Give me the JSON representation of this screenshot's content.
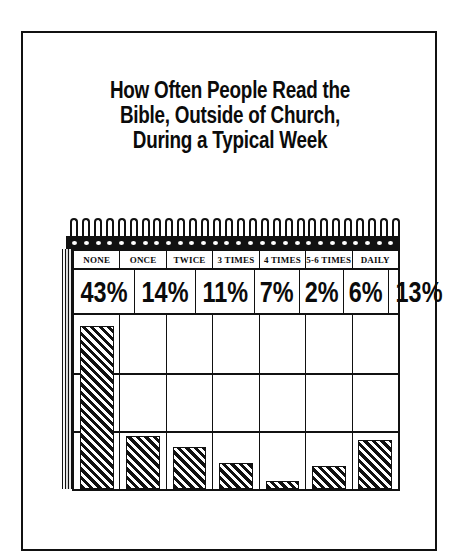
{
  "poster": {
    "title_lines": [
      "How Often People Read the",
      "Bible, Outside of Church,",
      "During a Typical Week"
    ]
  },
  "notepad": {
    "spiral_loop_count": 28,
    "binder_hole_count": 28
  },
  "chart_data": {
    "type": "bar",
    "title": "How Often People Read the Bible, Outside of Church, During a Typical Week",
    "subtitle": "",
    "xlabel": "",
    "ylabel": "",
    "categories": [
      "NONE",
      "ONCE",
      "TWICE",
      "3 TIMES",
      "4 TIMES",
      "5-6 TIMES",
      "DAILY"
    ],
    "values": [
      43,
      14,
      11,
      7,
      2,
      6,
      13
    ],
    "value_labels": [
      "43%",
      "14%",
      "11%",
      "7%",
      "2%",
      "6%",
      "13%"
    ],
    "ylim": [
      0,
      46
    ],
    "grid": true,
    "grid_rows": 3,
    "legend": "none",
    "bar_fill": "diagonal-hatch",
    "colors": {
      "ink": "#111111",
      "paper": "#ffffff"
    }
  }
}
